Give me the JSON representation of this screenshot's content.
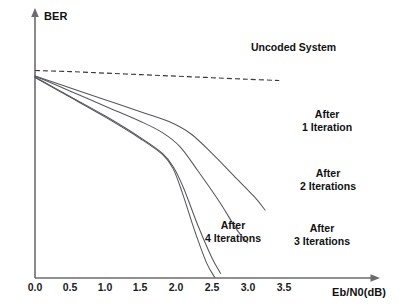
{
  "chart_data": {
    "type": "line",
    "title": "",
    "xlabel": "Eb/N0(dB)",
    "ylabel": "BER",
    "xlim": [
      0.0,
      3.9
    ],
    "ylim_note": "logarithmic BER axis, no numeric tick labels shown",
    "grid": false,
    "legend_position": "inline annotations beside each curve",
    "x_ticks": [
      "0.0",
      "0.5",
      "1.0",
      "1.5",
      "2.0",
      "2.5",
      "3.0",
      "3.5"
    ],
    "y_ticks": [],
    "annotations": [
      "Uncoded System",
      "After\n1 Iteration",
      "After\n2 Iterations",
      "After\n3 Iterations",
      "After\n4 Iterations"
    ],
    "series": [
      {
        "name": "Uncoded System",
        "style": "dashed",
        "x": [
          0.0,
          0.5,
          1.0,
          1.5,
          2.0,
          2.5,
          3.0,
          3.45
        ],
        "y_relative": [
          0.14,
          0.145,
          0.152,
          0.159,
          0.166,
          0.173,
          0.18,
          0.186
        ]
      },
      {
        "name": "After 1 Iteration",
        "style": "solid",
        "x": [
          0.0,
          0.5,
          1.0,
          1.5,
          1.9,
          2.2,
          2.5,
          2.8,
          3.1,
          3.25
        ],
        "y_relative": [
          0.165,
          0.22,
          0.275,
          0.33,
          0.375,
          0.43,
          0.52,
          0.62,
          0.72,
          0.78
        ]
      },
      {
        "name": "After 2 Iterations",
        "style": "solid",
        "x": [
          0.0,
          0.5,
          1.0,
          1.5,
          1.8,
          2.05,
          2.3,
          2.6,
          2.85,
          3.0
        ],
        "y_relative": [
          0.165,
          0.235,
          0.305,
          0.375,
          0.425,
          0.49,
          0.6,
          0.74,
          0.87,
          0.93
        ]
      },
      {
        "name": "After 3 Iterations",
        "style": "solid",
        "x": [
          0.0,
          0.5,
          1.0,
          1.5,
          1.8,
          1.95,
          2.1,
          2.3,
          2.5,
          2.62
        ],
        "y_relative": [
          0.17,
          0.26,
          0.35,
          0.45,
          0.52,
          0.58,
          0.68,
          0.85,
          1.0,
          1.07
        ]
      },
      {
        "name": "After 4 Iterations",
        "style": "solid",
        "x": [
          0.0,
          0.5,
          1.0,
          1.5,
          1.8,
          1.95,
          2.08,
          2.25,
          2.42,
          2.54
        ],
        "y_relative": [
          0.172,
          0.263,
          0.355,
          0.455,
          0.525,
          0.59,
          0.7,
          0.87,
          1.02,
          1.09
        ]
      }
    ]
  },
  "chart": {
    "y_axis_title": "BER",
    "x_axis_title": "Eb/N0(dB)",
    "x_tick_labels": [
      "0.0",
      "0.5",
      "1.0",
      "1.5",
      "2.0",
      "2.5",
      "3.0",
      "3.5"
    ],
    "annotations": {
      "uncoded": "Uncoded System",
      "iteration_1": "After\n1 Iteration",
      "iteration_2": "After\n2 Iterations",
      "iteration_3": "After\n3 Iterations",
      "iteration_4": "After\n4 Iterations"
    },
    "colors": {
      "axis": "#6b6b6b",
      "curve": "#55585c",
      "dashed_curve": "#3a3a3a",
      "text": "#111111",
      "background": "#ffffff"
    }
  }
}
